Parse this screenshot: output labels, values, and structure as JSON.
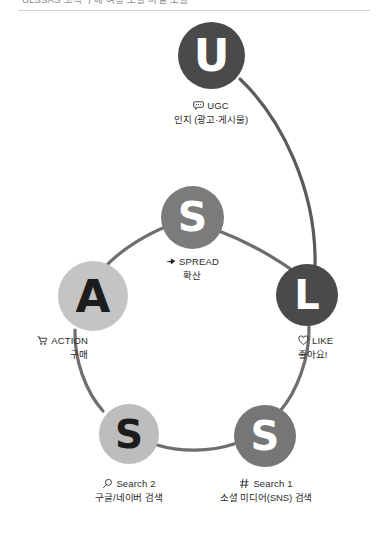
{
  "header": {
    "clipped_text": "ULSSAS 고객 구매 여정 모델 퍼널 모델",
    "rule_color": "#d2d2d6"
  },
  "diagram": {
    "title": "ULSSAS",
    "type": "cycle",
    "ring_color": "#6e6e72",
    "background": "#ffffff",
    "nodes": [
      {
        "key": "ugc",
        "letter": "U",
        "icon": "speech-bubble-icon",
        "label_en": "UGC",
        "label_ko": "인지 (광고·게시물)",
        "circle_color": "#4a4a4a",
        "letter_color": "#ffffff"
      },
      {
        "key": "like",
        "letter": "L",
        "icon": "heart-icon",
        "label_en": "LIKE",
        "label_ko": "좋아요!",
        "circle_color": "#4a4a4a",
        "letter_color": "#ffffff"
      },
      {
        "key": "search1",
        "letter": "S",
        "icon": "hash-icon",
        "label_en": "Search 1",
        "label_ko": "소셜 미디어(SNS) 검색",
        "circle_color": "#767676",
        "letter_color": "#ffffff"
      },
      {
        "key": "search2",
        "letter": "S",
        "icon": "magnifier-icon",
        "label_en": "Search 2",
        "label_ko": "구글/네이버 검색",
        "circle_color": "#bdbdbd",
        "letter_color": "#1c1c1c"
      },
      {
        "key": "action",
        "letter": "A",
        "icon": "shopping-cart-icon",
        "label_en": "ACTION",
        "label_ko": "구매",
        "circle_color": "#c4c4c4",
        "letter_color": "#1c1c1c"
      },
      {
        "key": "spread",
        "letter": "S",
        "icon": "arrow-icon",
        "label_en": "SPREAD",
        "label_ko": "확산",
        "circle_color": "#7b7b7b",
        "letter_color": "#ffffff"
      }
    ]
  }
}
